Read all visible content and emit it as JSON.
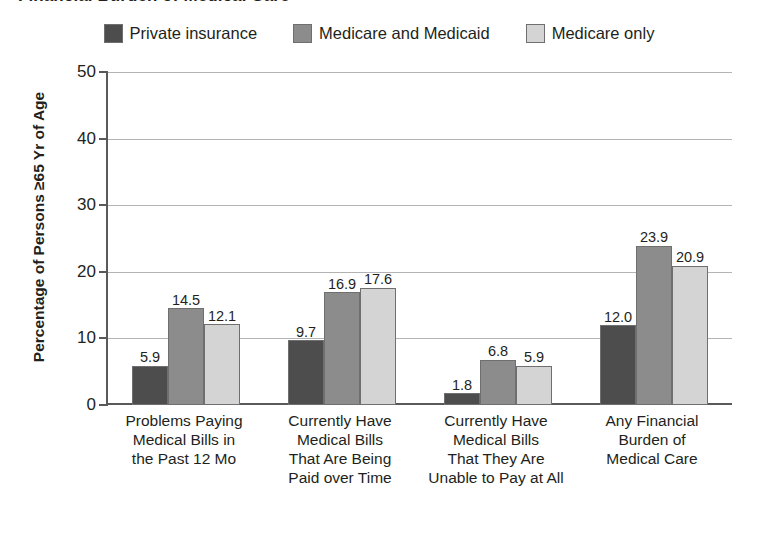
{
  "chart_data": {
    "type": "bar",
    "title": "Financial Burden of Medical Care",
    "xlabel": "",
    "ylabel": "Percentage of Persons ≥65 Yr of Age",
    "ylim": [
      0,
      50
    ],
    "yticks": [
      0,
      10,
      20,
      30,
      40,
      50
    ],
    "ytick_labels": [
      "0",
      "10",
      "20",
      "30",
      "40",
      "50"
    ],
    "grid": true,
    "legend_position": "top-center",
    "categories": [
      "Problems Paying Medical Bills in the Past 12 Mo",
      "Currently Have Medical Bills That Are Being Paid over Time",
      "Currently Have Medical Bills That They Are Unable to Pay at All",
      "Any Financial Burden of Medical Care"
    ],
    "category_lines": [
      [
        "Problems Paying",
        "Medical Bills in",
        "the Past 12 Mo"
      ],
      [
        "Currently Have",
        "Medical Bills",
        "That Are Being",
        "Paid over Time"
      ],
      [
        "Currently Have",
        "Medical Bills",
        "That They Are",
        "Unable to Pay at All"
      ],
      [
        "Any Financial",
        "Burden of",
        "Medical Care"
      ]
    ],
    "series": [
      {
        "name": "Private insurance",
        "color": "#4d4d4d",
        "values": [
          5.9,
          9.7,
          1.8,
          12.0
        ],
        "labels": [
          "5.9",
          "9.7",
          "1.8",
          "12.0"
        ]
      },
      {
        "name": "Medicare and Medicaid",
        "color": "#8c8c8c",
        "values": [
          14.5,
          16.9,
          6.8,
          23.9
        ],
        "labels": [
          "14.5",
          "16.9",
          "6.8",
          "23.9"
        ]
      },
      {
        "name": "Medicare only",
        "color": "#d4d4d4",
        "values": [
          12.1,
          17.6,
          5.9,
          20.9
        ],
        "labels": [
          "12.1",
          "17.6",
          "5.9",
          "20.9"
        ]
      }
    ]
  },
  "colors": {
    "axis": "#58595b",
    "gridline": "#b3b3b3",
    "bar_outline": "#6f6f6f",
    "text": "#231f20",
    "background": "#ffffff"
  }
}
